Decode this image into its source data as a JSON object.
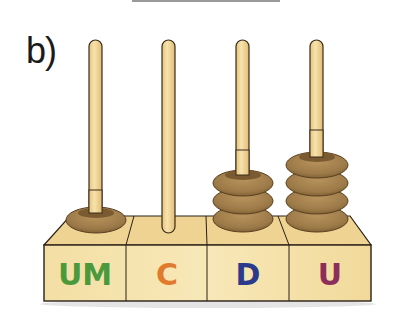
{
  "exercise": {
    "label": "b)"
  },
  "abacus": {
    "columns": [
      {
        "label": "UM",
        "name": "unidades-de-millar",
        "beads": 1,
        "color": "#4a9a3c"
      },
      {
        "label": "C",
        "name": "centenas",
        "beads": 0,
        "color": "#e07a2c"
      },
      {
        "label": "D",
        "name": "decenas",
        "beads": 3,
        "color": "#2c3a8c"
      },
      {
        "label": "U",
        "name": "unidades",
        "beads": 4,
        "color": "#8c2e5a"
      }
    ],
    "represented_number": "1034"
  },
  "colors": {
    "rod": "#f2d79a",
    "rod_outline": "#3a2a1a",
    "bead": "#9c7a48",
    "bead_dark": "#6e5028",
    "bead_light": "#b8935c",
    "base_front": "#f5e2a8",
    "base_top": "#f0d48e",
    "outline": "#2a2018"
  }
}
